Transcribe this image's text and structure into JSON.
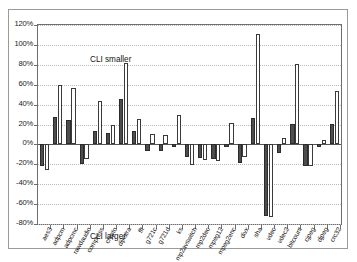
{
  "annotations": {
    "top": "CLI smaller",
    "bottom": "CLI larger"
  },
  "axis": {
    "yticks": [
      "120%",
      "100%",
      "80%",
      "60%",
      "40%",
      "20%",
      "0%",
      "-20%",
      "-40%",
      "-60%",
      "-80%"
    ]
  },
  "chart_data": {
    "type": "bar",
    "title": "",
    "xlabel": "",
    "ylabel": "",
    "ylim": [
      -80,
      120
    ],
    "ytick_values": [
      120,
      100,
      80,
      60,
      40,
      20,
      0,
      -20,
      -40,
      -60,
      -80
    ],
    "ytick_labels": [
      "120%",
      "100%",
      "80%",
      "60%",
      "40%",
      "20%",
      "0%",
      "-20%",
      "-40%",
      "-60%",
      "-80%"
    ],
    "grid": true,
    "legend": "none",
    "annotations": [
      "CLI smaller",
      "CLI larger"
    ],
    "categories": [
      "aes3",
      "adpcm",
      "adpcmc",
      "rawdaudio",
      "compress",
      "crypto",
      "dijkstra",
      "fft",
      "g721c",
      "g721d",
      "ks",
      "mp2avswitch",
      "mp2dec",
      "mpeg12",
      "mpeg2enc",
      "divx",
      "sha",
      "vdec",
      "vdec2",
      "bitcount",
      "cjpeg",
      "djpeg",
      "crc32"
    ],
    "series": [
      {
        "name": "dark",
        "fill": "#4d4d4d",
        "values": [
          -22,
          28,
          25,
          -20,
          13,
          11,
          46,
          13,
          -7,
          -7,
          -3,
          -13,
          -14,
          -15,
          -3,
          -19,
          27,
          -72,
          -9,
          21,
          -22,
          -3,
          21
        ]
      },
      {
        "name": "light",
        "fill": "#ffffff",
        "values": [
          -26,
          60,
          57,
          -15,
          44,
          19,
          82,
          26,
          10,
          9,
          30,
          -21,
          -16,
          -17,
          22,
          -13,
          111,
          -73,
          6,
          81,
          -22,
          4,
          54
        ]
      }
    ]
  }
}
